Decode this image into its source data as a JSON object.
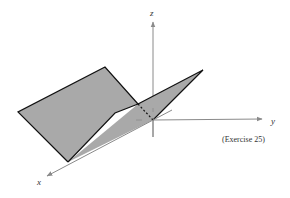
{
  "figure": {
    "caption": "(Exercise 25)",
    "axes": {
      "x_label": "x",
      "y_label": "y",
      "z_label": "z"
    },
    "colors": {
      "plane_fill": "#a9a9a9",
      "plane_edge": "#111111",
      "axis": "#8a8a8a",
      "text": "#333333"
    }
  }
}
